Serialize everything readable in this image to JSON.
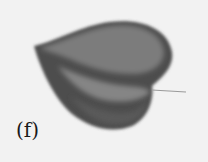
{
  "figure": {
    "panel_label": "(f)",
    "colors": {
      "background": "#f2f2f2",
      "body_dark": "#4a4a4a",
      "body_mid": "#6e6e6e",
      "body_light": "#8a8a8a",
      "stem": "#9a9a9a"
    }
  }
}
